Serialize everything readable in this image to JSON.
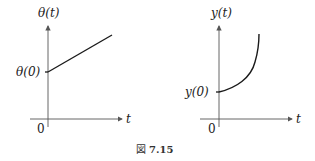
{
  "figures": [
    {
      "id": "left",
      "y_label": "θ(t)",
      "x_label": "t",
      "origin_label": "0",
      "intercept_label": "θ(0)",
      "curve_type": "linear"
    },
    {
      "id": "right",
      "y_label": "y(t)",
      "x_label": "t",
      "origin_label": "0",
      "intercept_label": "y(0)",
      "curve_type": "exponential"
    }
  ],
  "caption": {
    "prefix": "図",
    "number": "7.15"
  },
  "colors": {
    "line": "#1a1a1a",
    "axis": "#555555",
    "background": "#ffffff"
  }
}
